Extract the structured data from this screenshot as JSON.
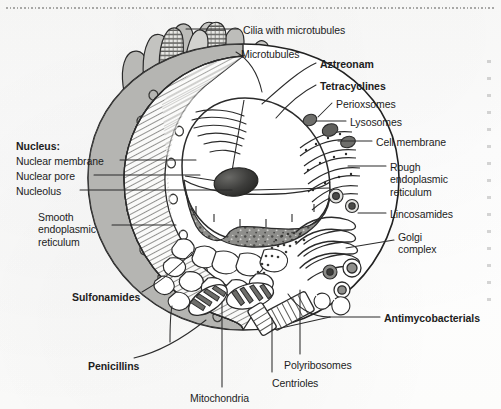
{
  "figure": {
    "type": "labeled-biological-diagram",
    "style": "scanned textbook line art, greyscale"
  },
  "labels": [
    {
      "id": "cilia-with-microtubules",
      "text": "Cilia with microtubules",
      "bold": false,
      "x": 243,
      "y": 24
    },
    {
      "id": "microtubules",
      "text": "Microtubules",
      "bold": false,
      "x": 241,
      "y": 48
    },
    {
      "id": "aztreonam",
      "text": "Aztreonam",
      "bold": true,
      "x": 320,
      "y": 58
    },
    {
      "id": "tetracyclines",
      "text": "Tetracyclines",
      "bold": true,
      "x": 320,
      "y": 80
    },
    {
      "id": "perioxsomes",
      "text": "Perioxsomes",
      "bold": false,
      "x": 336,
      "y": 98
    },
    {
      "id": "lysosomes",
      "text": "Lysosomes",
      "bold": false,
      "x": 350,
      "y": 116
    },
    {
      "id": "cell-membrane",
      "text": "Cell membrane",
      "bold": false,
      "x": 376,
      "y": 136
    },
    {
      "id": "rough-endoplasmic-reticulum",
      "text": "Rough\nendoplasmic\nreticulum",
      "bold": false,
      "x": 390,
      "y": 161
    },
    {
      "id": "lincosamides",
      "text": "Lincosamides",
      "bold": false,
      "x": 390,
      "y": 208
    },
    {
      "id": "golgi-complex",
      "text": "Golgi\ncomplex",
      "bold": false,
      "x": 398,
      "y": 231
    },
    {
      "id": "antimycobacterials",
      "text": "Antimycobacterials",
      "bold": true,
      "x": 384,
      "y": 312
    },
    {
      "id": "polyribosomes",
      "text": "Polyribosomes",
      "bold": false,
      "x": 284,
      "y": 359
    },
    {
      "id": "centrioles",
      "text": "Centrioles",
      "bold": false,
      "x": 272,
      "y": 377
    },
    {
      "id": "mitochondria",
      "text": "Mitochondria",
      "bold": false,
      "x": 190,
      "y": 392
    },
    {
      "id": "penicillins",
      "text": "Penicillins",
      "bold": true,
      "x": 88,
      "y": 360
    },
    {
      "id": "sulfonamides",
      "text": "Sulfonamides",
      "bold": true,
      "x": 72,
      "y": 291
    },
    {
      "id": "smooth-endoplasmic-reticulum",
      "text": "Smooth\nendoplasmic\nreticulum",
      "bold": false,
      "x": 38,
      "y": 211
    },
    {
      "id": "nucleus-heading",
      "text": "Nucleus:",
      "bold": true,
      "x": 16,
      "y": 140
    },
    {
      "id": "nuclear-membrane",
      "text": "Nuclear membrane",
      "bold": false,
      "x": 16,
      "y": 155
    },
    {
      "id": "nuclear-pore",
      "text": "Nuclear pore",
      "bold": false,
      "x": 16,
      "y": 170
    },
    {
      "id": "nucleolus",
      "text": "Nucleolus",
      "bold": false,
      "x": 16,
      "y": 185
    }
  ],
  "antibiotics": [
    "Aztreonam",
    "Tetracyclines",
    "Lincosamides",
    "Antimycobacterials",
    "Penicillins",
    "Sulfonamides"
  ],
  "organelles": [
    "Cilia with microtubules",
    "Microtubules",
    "Perioxsomes",
    "Lysosomes",
    "Cell membrane",
    "Rough endoplasmic reticulum",
    "Golgi complex",
    "Polyribosomes",
    "Centrioles",
    "Mitochondria",
    "Smooth endoplasmic reticulum",
    "Nuclear membrane",
    "Nuclear pore",
    "Nucleolus"
  ],
  "colors": {
    "ink": "#1d1d1d",
    "line": "#2b2b2b",
    "membrane_fill": "#b9b9b6",
    "cytoplasm_hatch": "#d9d9d6",
    "nucleus_rim": "#8d8d8a",
    "nucleolus": "#3a3a38",
    "paper": "#fdfdfc"
  }
}
